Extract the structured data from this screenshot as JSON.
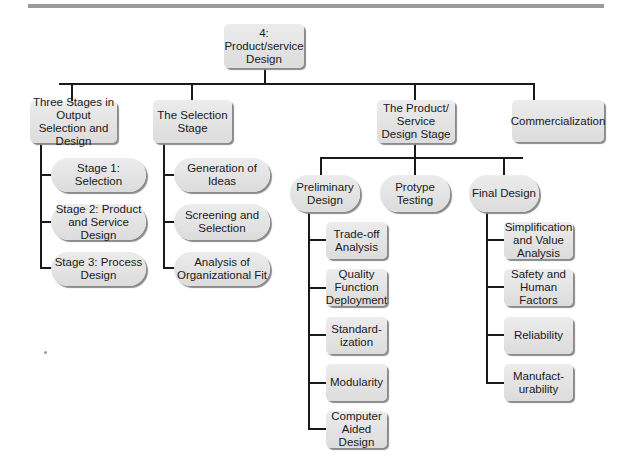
{
  "diagram": {
    "type": "hierarchy-chart",
    "root": {
      "label": "4: Product/service\nDesign"
    },
    "level1": [
      {
        "label": "Three Stages in Output Selection and Design",
        "children": [
          "Stage 1: Selection",
          "Stage 2: Product and Service Design",
          "Stage 3: Process Design"
        ]
      },
      {
        "label": "The Selection Stage",
        "children": [
          "Generation of Ideas",
          "Screening and Selection",
          "Analysis of Organizational Fit"
        ]
      },
      {
        "label": "The Product/ Service Design Stage",
        "children": [
          {
            "label": "Preliminary Design",
            "children": [
              "Trade-off Analysis",
              "Quality Function Deployment",
              "Standard- ization",
              "Modularity",
              "Computer Aided Design"
            ]
          },
          {
            "label": "Protype Testing"
          },
          {
            "label": "Final Design",
            "children": [
              "Simplification and Value Analysis",
              "Safety and Human Factors",
              "Reliability",
              "Manufact- urability"
            ]
          }
        ]
      },
      {
        "label": "Commercialization"
      }
    ]
  },
  "nodes": {
    "root": "4: Product/service Design",
    "three_stages": "Three Stages in Output Selection and Design",
    "stage1": "Stage 1: Selection",
    "stage2": "Stage 2: Product and Service Design",
    "stage3": "Stage 3: Process Design",
    "selection_stage": "The Selection Stage",
    "generation": "Generation of Ideas",
    "screening": "Screening and Selection",
    "analysis_fit": "Analysis of Organizational Fit",
    "ps_design_stage": "The Product/ Service Design Stage",
    "preliminary": "Preliminary Design",
    "protype": "Protype Testing",
    "final": "Final Design",
    "tradeoff": "Trade-off Analysis",
    "qfd": "Quality Function Deployment",
    "standard": "Standard- ization",
    "modularity": "Modularity",
    "cad": "Computer Aided Design",
    "simplification": "Simplification and Value Analysis",
    "safety": "Safety and Human Factors",
    "reliability": "Reliability",
    "manufact": "Manufact- urability",
    "commercialization": "Commercialization"
  },
  "colors": {
    "box_fill": "#e4e4e4",
    "line": "#1a1a1a",
    "top_bar": "#9a9a9a"
  }
}
